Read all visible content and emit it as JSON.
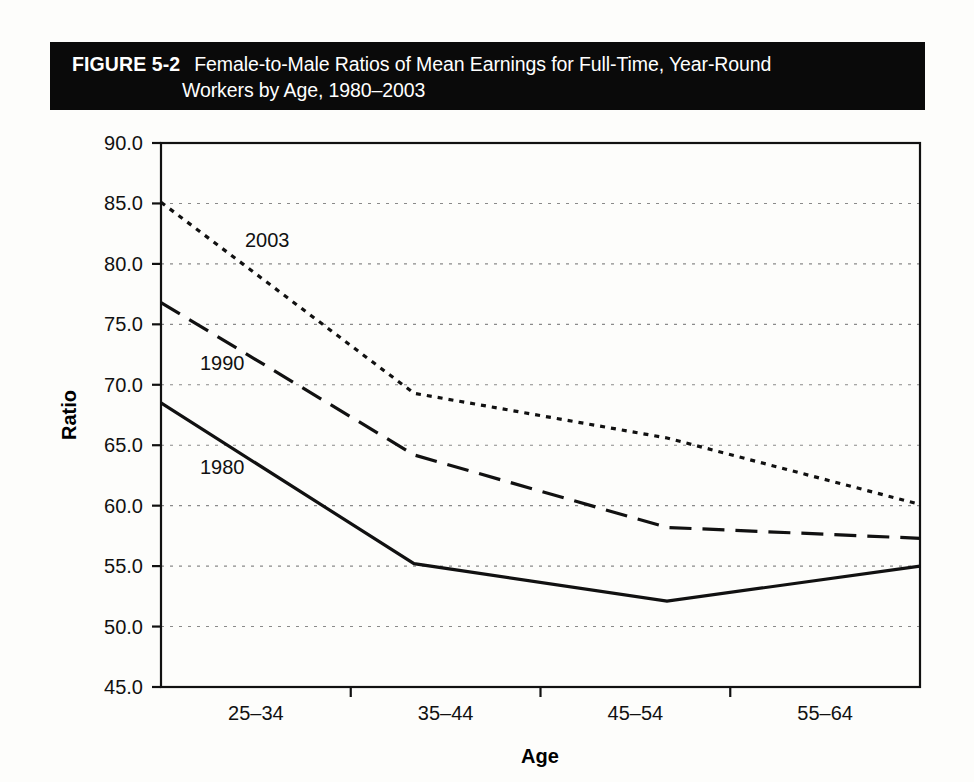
{
  "figure": {
    "label": "FIGURE 5-2",
    "title_line_1": "Female-to-Male Ratios of Mean Earnings for Full-Time, Year-Round",
    "title_line_2": "Workers by Age, 1980–2003",
    "title_bar_color": "#0a0a0a",
    "title_text_color": "#ffffff"
  },
  "chart_data": {
    "type": "line",
    "title": "Female-to-Male Ratios of Mean Earnings for Full-Time, Year-Round Workers by Age, 1980–2003",
    "xlabel": "Age",
    "ylabel": "Ratio",
    "categories": [
      "25–34",
      "35–44",
      "45–54",
      "55–64"
    ],
    "ylim": [
      45.0,
      90.0
    ],
    "ytick_step": 5.0,
    "yticks": [
      "90.0",
      "85.0",
      "80.0",
      "75.0",
      "70.0",
      "65.0",
      "60.0",
      "55.0",
      "50.0",
      "45.0"
    ],
    "ytick_values": [
      90.0,
      85.0,
      80.0,
      75.0,
      70.0,
      65.0,
      60.0,
      55.0,
      50.0,
      45.0
    ],
    "grid": "horizontal-dotted",
    "legend_position": "inline-series-labels",
    "series": [
      {
        "name": "2003",
        "style": "dotted",
        "color": "#111111",
        "values": [
          85.1,
          69.3,
          65.6,
          60.1
        ],
        "label_x_category": "25–34",
        "label_value": 82.0
      },
      {
        "name": "1990",
        "style": "dashed",
        "color": "#111111",
        "values": [
          76.8,
          64.2,
          58.2,
          57.3
        ],
        "label_x_category": "25–34",
        "label_value": 71.8
      },
      {
        "name": "1980",
        "style": "solid",
        "color": "#111111",
        "values": [
          68.5,
          55.2,
          52.1,
          55.0
        ],
        "label_x_category": "25–34",
        "label_value": 63.2
      }
    ]
  },
  "axes": {
    "y_axis_title": "Ratio",
    "x_axis_title": "Age"
  }
}
